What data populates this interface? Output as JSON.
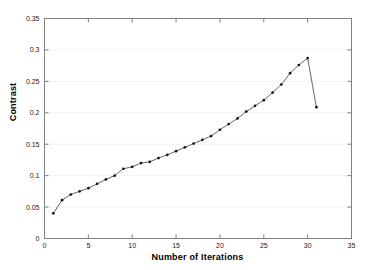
{
  "chart_data": {
    "type": "line",
    "title": "",
    "xlabel": "Number of Iterations",
    "ylabel": "Contrast",
    "xlim": [
      0,
      35
    ],
    "ylim": [
      0,
      0.35
    ],
    "xticks": [
      0,
      5,
      10,
      15,
      20,
      25,
      30,
      35
    ],
    "xticklabels": [
      "0",
      "5",
      "10",
      "15",
      "20",
      "25",
      "30",
      "35"
    ],
    "yticks": [
      0,
      0.05,
      0.1,
      0.15,
      0.2,
      0.25,
      0.3,
      0.35
    ],
    "yticklabels": [
      "0",
      "0.05",
      "0.1",
      "0.15",
      "0.2",
      "0.25",
      "0.3",
      "0.35"
    ],
    "grid": true,
    "grid_axis": "y",
    "legend": null,
    "marker": "dot",
    "line_color": "#555555",
    "marker_color": "#111111",
    "grid_color": "#f2f2f2",
    "axis_color": "#808080",
    "x": [
      1,
      2,
      3,
      4,
      5,
      6,
      7,
      8,
      9,
      10,
      11,
      12,
      13,
      14,
      15,
      16,
      17,
      18,
      19,
      20,
      21,
      22,
      23,
      24,
      25,
      26,
      27,
      28,
      29,
      30,
      31
    ],
    "values": [
      0.04,
      0.061,
      0.07,
      0.075,
      0.08,
      0.087,
      0.094,
      0.1,
      0.111,
      0.114,
      0.12,
      0.122,
      0.128,
      0.133,
      0.139,
      0.145,
      0.151,
      0.157,
      0.163,
      0.173,
      0.182,
      0.191,
      0.202,
      0.211,
      0.22,
      0.232,
      0.245,
      0.263,
      0.276,
      0.287,
      0.209
    ],
    "series": [
      {
        "name": "Contrast",
        "values": [
          0.04,
          0.061,
          0.07,
          0.075,
          0.08,
          0.087,
          0.094,
          0.1,
          0.111,
          0.114,
          0.12,
          0.122,
          0.128,
          0.133,
          0.139,
          0.145,
          0.151,
          0.157,
          0.163,
          0.173,
          0.182,
          0.191,
          0.202,
          0.211,
          0.22,
          0.232,
          0.245,
          0.263,
          0.276,
          0.287,
          0.209
        ]
      }
    ],
    "annotations": []
  }
}
